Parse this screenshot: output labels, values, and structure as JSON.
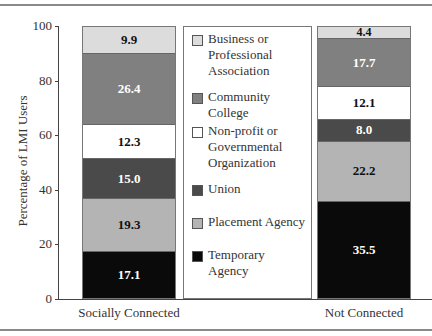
{
  "chart_data": {
    "type": "bar",
    "stacked": true,
    "title": "",
    "xlabel": "",
    "ylabel": "Percentage of LMI Users",
    "ylim": [
      0,
      100
    ],
    "yticks": [
      0,
      20,
      40,
      60,
      80,
      100
    ],
    "grid": false,
    "legend_position": "center (between bars)",
    "categories": [
      "Socially Connected",
      "Not Connected"
    ],
    "series": [
      {
        "name": "Temporary Agency",
        "color": "#0a0a0a",
        "values": [
          17.1,
          35.5
        ]
      },
      {
        "name": "Placement Agency",
        "color": "#b4b4b4",
        "values": [
          19.3,
          22.2
        ]
      },
      {
        "name": "Union",
        "color": "#4a4a4a",
        "values": [
          15.0,
          8.0
        ]
      },
      {
        "name": "Non-profit or Governmental Organization",
        "color": "#ffffff",
        "values": [
          12.3,
          12.1
        ]
      },
      {
        "name": "Community College",
        "color": "#808080",
        "values": [
          26.4,
          17.7
        ]
      },
      {
        "name": "Business or Professional Association",
        "color": "#dcdcdc",
        "values": [
          9.9,
          4.4
        ]
      }
    ]
  },
  "axis": {
    "ylabel": "Percentage of LMI Users",
    "ticks": [
      "0",
      "20",
      "40",
      "60",
      "80",
      "100"
    ]
  },
  "bars": [
    {
      "label": "Socially Connected",
      "segments": [
        {
          "name": "Temporary Agency",
          "value": "17.1",
          "color": "#0a0a0a",
          "text": "#ffffff"
        },
        {
          "name": "Placement Agency",
          "value": "19.3",
          "color": "#b4b4b4",
          "text": "#111111"
        },
        {
          "name": "Union",
          "value": "15.0",
          "color": "#4a4a4a",
          "text": "#ffffff"
        },
        {
          "name": "Non-profit or Governmental Organization",
          "value": "12.3",
          "color": "#ffffff",
          "text": "#111111"
        },
        {
          "name": "Community College",
          "value": "26.4",
          "color": "#808080",
          "text": "#ffffff"
        },
        {
          "name": "Business or Professional Association",
          "value": "9.9",
          "color": "#dcdcdc",
          "text": "#111111"
        }
      ]
    },
    {
      "label": "Not Connected",
      "segments": [
        {
          "name": "Temporary Agency",
          "value": "35.5",
          "color": "#0a0a0a",
          "text": "#ffffff"
        },
        {
          "name": "Placement Agency",
          "value": "22.2",
          "color": "#b4b4b4",
          "text": "#111111"
        },
        {
          "name": "Union",
          "value": "8.0",
          "color": "#4a4a4a",
          "text": "#ffffff"
        },
        {
          "name": "Non-profit or Governmental Organization",
          "value": "12.1",
          "color": "#ffffff",
          "text": "#111111"
        },
        {
          "name": "Community College",
          "value": "17.7",
          "color": "#808080",
          "text": "#ffffff"
        },
        {
          "name": "Business or Professional Association",
          "value": "4.4",
          "color": "#dcdcdc",
          "text": "#111111"
        }
      ]
    }
  ],
  "legend": [
    {
      "label": "Business or Professional Association",
      "lines": [
        "Business or",
        "Professional",
        "Association"
      ],
      "color": "#dcdcdc"
    },
    {
      "label": "Community College",
      "lines": [
        "Community College"
      ],
      "color": "#808080"
    },
    {
      "label": "Non-profit or Governmental Organization",
      "lines": [
        "Non-profit or",
        "Governmental",
        "Organization"
      ],
      "color": "#ffffff"
    },
    {
      "label": "Union",
      "lines": [
        "Union"
      ],
      "color": "#4a4a4a"
    },
    {
      "label": "Placement Agency",
      "lines": [
        "Placement Agency"
      ],
      "color": "#b4b4b4"
    },
    {
      "label": "Temporary Agency",
      "lines": [
        "Temporary Agency"
      ],
      "color": "#0a0a0a"
    }
  ]
}
